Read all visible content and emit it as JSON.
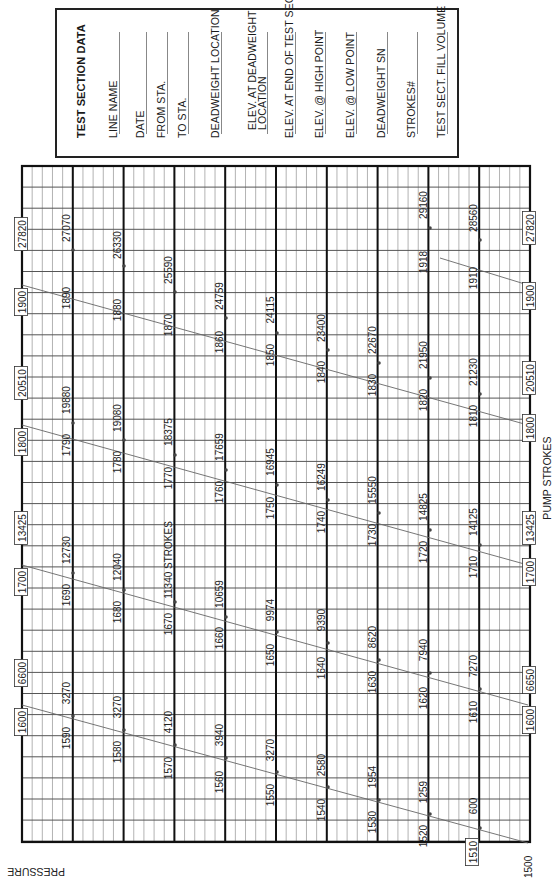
{
  "info_box": {
    "title": "TEST SECTION DATA",
    "fields": [
      {
        "label": "LINE NAME",
        "value": ""
      },
      {
        "label": "DATE",
        "value": ""
      },
      {
        "label": "FROM STA.",
        "value": ""
      },
      {
        "label": "TO STA.",
        "value": ""
      },
      {
        "label": "DEADWEIGHT LOCATION",
        "value": ""
      },
      {
        "label": "ELEV. AT DEADWEIGHT LOCATION",
        "value": ""
      },
      {
        "label": "ELEV. AT END OF TEST SECT.",
        "value": ""
      },
      {
        "label": "ELEV. @ HIGH POINT",
        "value": ""
      },
      {
        "label": "ELEV. @ LOW POINT",
        "value": ""
      },
      {
        "label": "DEADWEIGHT SN",
        "value": ""
      },
      {
        "label": "STROKES#",
        "value": ""
      },
      {
        "label": "TEST SECT.  FILL VOLUME",
        "value": ""
      }
    ]
  },
  "chart_data": {
    "type": "line",
    "title": "TEST SECTION DATA",
    "xlabel": "PUMP STROKES",
    "ylabel": "PRESSURE",
    "orientation": "rotated-90",
    "origin_label": "1500",
    "grid": true,
    "left_axis_labels": [
      {
        "text": "27820",
        "y": 234
      },
      {
        "text": "1900",
        "y": 302
      },
      {
        "text": "20510",
        "y": 383
      },
      {
        "text": "1800",
        "y": 442
      },
      {
        "text": "13425",
        "y": 528
      },
      {
        "text": "1700",
        "y": 582
      },
      {
        "text": "6600",
        "y": 673
      },
      {
        "text": "1600",
        "y": 722
      }
    ],
    "right_axis_labels": [
      {
        "text": "27820",
        "y": 228
      },
      {
        "text": "1900",
        "y": 296
      },
      {
        "text": "20510",
        "y": 378
      },
      {
        "text": "1800",
        "y": 428
      },
      {
        "text": "13425",
        "y": 528
      },
      {
        "text": "1700",
        "y": 572
      },
      {
        "text": "6650",
        "y": 680
      },
      {
        "text": "1600",
        "y": 720
      }
    ],
    "series": [
      {
        "name": "1900-1800",
        "points": [
          {
            "pressure": 1918,
            "strokes": 29160
          },
          {
            "pressure": 1910,
            "strokes": 28560
          },
          {
            "pressure": 1890,
            "strokes": 27070
          },
          {
            "pressure": 1880,
            "strokes": 26330
          },
          {
            "pressure": 1870,
            "strokes": 25590
          },
          {
            "pressure": 1860,
            "strokes": 24759
          },
          {
            "pressure": 1850,
            "strokes": 24115
          },
          {
            "pressure": 1840,
            "strokes": 23400
          },
          {
            "pressure": 1830,
            "strokes": 22670
          },
          {
            "pressure": 1820,
            "strokes": 21950
          },
          {
            "pressure": 1810,
            "strokes": 21230
          }
        ]
      },
      {
        "name": "1800-1700",
        "points": [
          {
            "pressure": 1790,
            "strokes": 19880
          },
          {
            "pressure": 1780,
            "strokes": 19080
          },
          {
            "pressure": 1770,
            "strokes": 18375
          },
          {
            "pressure": 1760,
            "strokes": 17659
          },
          {
            "pressure": 1750,
            "strokes": 16945
          },
          {
            "pressure": 1740,
            "strokes": 16249
          },
          {
            "pressure": 1730,
            "strokes": 15550
          },
          {
            "pressure": 1720,
            "strokes": 14825
          },
          {
            "pressure": 1710,
            "strokes": 14125
          }
        ]
      },
      {
        "name": "1700-1600",
        "points": [
          {
            "pressure": 1690,
            "strokes": 12730
          },
          {
            "pressure": 1680,
            "strokes": 12040
          },
          {
            "pressure": 1670,
            "strokes": "11340 STROKES"
          },
          {
            "pressure": 1660,
            "strokes": 10659
          },
          {
            "pressure": 1650,
            "strokes": 9974
          },
          {
            "pressure": 1640,
            "strokes": 9390
          },
          {
            "pressure": 1630,
            "strokes": 8620
          },
          {
            "pressure": 1620,
            "strokes": 7940
          },
          {
            "pressure": 1610,
            "strokes": 7270
          }
        ]
      },
      {
        "name": "1600-1500",
        "points": [
          {
            "pressure": 1590,
            "strokes": 3270
          },
          {
            "pressure": 1580,
            "strokes": 3270
          },
          {
            "pressure": 1570,
            "strokes": 4120
          },
          {
            "pressure": 1560,
            "strokes": 3940
          },
          {
            "pressure": 1550,
            "strokes": 3270
          },
          {
            "pressure": 1540,
            "strokes": 2580
          },
          {
            "pressure": 1530,
            "strokes": 1954
          },
          {
            "pressure": 1520,
            "strokes": 1259
          },
          {
            "pressure": 1510,
            "strokes": 600
          }
        ]
      }
    ],
    "plot_points": [
      {
        "x": 430,
        "y": 228,
        "p": "1918",
        "s": "29160",
        "py": 262,
        "sy": 205
      },
      {
        "x": 480,
        "y": 240,
        "p": "1910",
        "s": "28560",
        "py": 278,
        "sy": 218
      },
      {
        "x": 73,
        "y": 250,
        "p": "1890",
        "s": "27070",
        "py": 298,
        "sy": 228
      },
      {
        "x": 124,
        "y": 266,
        "p": "1880",
        "s": "26330",
        "py": 310,
        "sy": 245
      },
      {
        "x": 175,
        "y": 292,
        "p": "1870",
        "s": "25590",
        "py": 325,
        "sy": 270
      },
      {
        "x": 226,
        "y": 318,
        "p": "1860",
        "s": "24759",
        "py": 342,
        "sy": 296
      },
      {
        "x": 277,
        "y": 333,
        "p": "1850",
        "s": "24115",
        "py": 355,
        "sy": 310
      },
      {
        "x": 328,
        "y": 350,
        "p": "1840",
        "s": "23400",
        "py": 372,
        "sy": 328
      },
      {
        "x": 379,
        "y": 363,
        "p": "1830",
        "s": "22670",
        "py": 385,
        "sy": 340
      },
      {
        "x": 430,
        "y": 378,
        "p": "1820",
        "s": "21950",
        "py": 400,
        "sy": 355
      },
      {
        "x": 480,
        "y": 394,
        "p": "1810",
        "s": "21230",
        "py": 416,
        "sy": 372
      },
      {
        "x": 73,
        "y": 423,
        "p": "1790",
        "s": "19880",
        "py": 445,
        "sy": 400
      },
      {
        "x": 124,
        "y": 440,
        "p": "1780",
        "s": "19080",
        "py": 462,
        "sy": 418
      },
      {
        "x": 175,
        "y": 455,
        "p": "1770",
        "s": "18375",
        "py": 478,
        "sy": 432
      },
      {
        "x": 226,
        "y": 470,
        "p": "1760",
        "s": "17659",
        "py": 492,
        "sy": 447
      },
      {
        "x": 277,
        "y": 485,
        "p": "1750",
        "s": "16945",
        "py": 508,
        "sy": 462
      },
      {
        "x": 328,
        "y": 500,
        "p": "1740",
        "s": "16249",
        "py": 522,
        "sy": 477
      },
      {
        "x": 379,
        "y": 513,
        "p": "1730",
        "s": "15550",
        "py": 535,
        "sy": 490
      },
      {
        "x": 430,
        "y": 530,
        "p": "1720",
        "s": "14825",
        "py": 552,
        "sy": 507
      },
      {
        "x": 480,
        "y": 545,
        "p": "1710",
        "s": "14125",
        "py": 567,
        "sy": 522
      },
      {
        "x": 73,
        "y": 573,
        "p": "1690",
        "s": "12730",
        "py": 595,
        "sy": 550
      },
      {
        "x": 124,
        "y": 590,
        "p": "1680",
        "s": "12040",
        "py": 612,
        "sy": 567
      },
      {
        "x": 175,
        "y": 602,
        "p": "1670",
        "s": "11340 STROKES",
        "py": 624,
        "sy": 580
      },
      {
        "x": 226,
        "y": 617,
        "p": "1660",
        "s": "10659",
        "py": 638,
        "sy": 594
      },
      {
        "x": 277,
        "y": 632,
        "p": "1650",
        "s": "9974",
        "py": 655,
        "sy": 610
      },
      {
        "x": 328,
        "y": 643,
        "p": "1640",
        "s": "9390",
        "py": 668,
        "sy": 620
      },
      {
        "x": 379,
        "y": 660,
        "p": "1630",
        "s": "8620",
        "py": 682,
        "sy": 637
      },
      {
        "x": 430,
        "y": 673,
        "p": "1620",
        "s": "7940",
        "py": 698,
        "sy": 650
      },
      {
        "x": 480,
        "y": 689,
        "p": "1610",
        "s": "7270",
        "py": 712,
        "sy": 666
      },
      {
        "x": 73,
        "y": 716,
        "p": "1590",
        "s": "3270",
        "py": 738,
        "sy": 693
      },
      {
        "x": 124,
        "y": 730,
        "p": "1580",
        "s": "3270",
        "py": 752,
        "sy": 707
      },
      {
        "x": 175,
        "y": 745,
        "p": "1570",
        "s": "4120",
        "py": 768,
        "sy": 722
      },
      {
        "x": 226,
        "y": 758,
        "p": "1560",
        "s": "3940",
        "py": 782,
        "sy": 735
      },
      {
        "x": 277,
        "y": 772,
        "p": "1550",
        "s": "3270",
        "py": 795,
        "sy": 750
      },
      {
        "x": 328,
        "y": 787,
        "p": "1540",
        "s": "2580",
        "py": 810,
        "sy": 765
      },
      {
        "x": 379,
        "y": 800,
        "p": "1530",
        "s": "1954",
        "py": 822,
        "sy": 777
      },
      {
        "x": 430,
        "y": 814,
        "p": "1520",
        "s": "1259",
        "py": 836,
        "sy": 792
      },
      {
        "x": 480,
        "y": 828,
        "p": "1510",
        "s": "600",
        "py": 852,
        "sy": 806,
        "boxed": true
      }
    ],
    "diagonals": [
      {
        "x1": 22,
        "y1": 285,
        "x2": 528,
        "y2": 425
      },
      {
        "x1": 22,
        "y1": 425,
        "x2": 528,
        "y2": 565
      },
      {
        "x1": 22,
        "y1": 565,
        "x2": 528,
        "y2": 705
      },
      {
        "x1": 22,
        "y1": 705,
        "x2": 528,
        "y2": 843
      },
      {
        "x1": 440,
        "y1": 258,
        "x2": 528,
        "y2": 285
      }
    ]
  }
}
